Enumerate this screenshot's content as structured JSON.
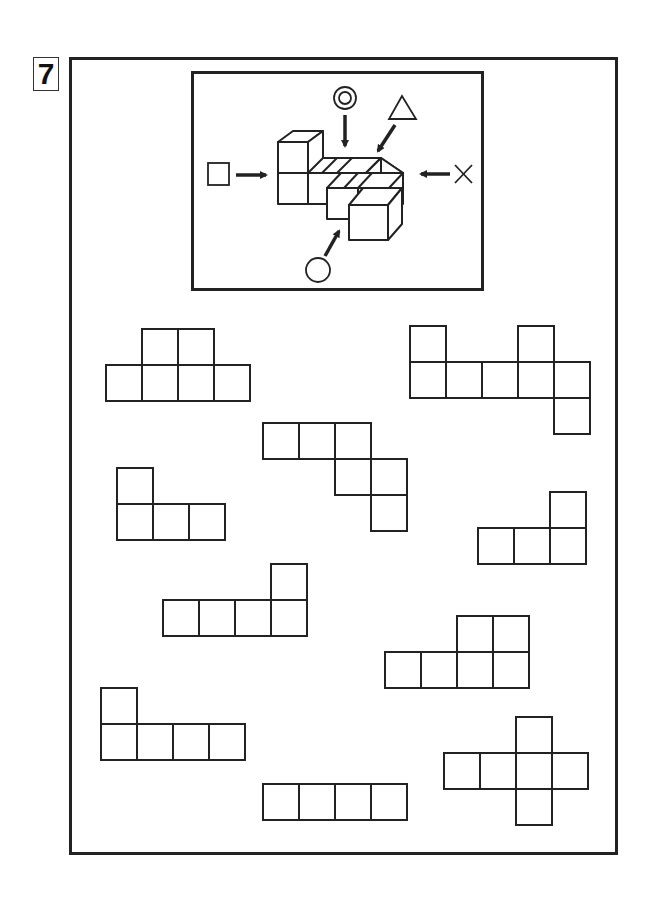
{
  "problem": {
    "number": "7"
  },
  "colors": {
    "stroke": "#222222",
    "background": "#ffffff"
  },
  "view_figure": {
    "description": "isometric block figure with five viewing-direction markers",
    "markers": [
      {
        "symbol": "square",
        "direction": "from-left"
      },
      {
        "symbol": "double-circle",
        "direction": "from-top"
      },
      {
        "symbol": "triangle",
        "direction": "from-top-right"
      },
      {
        "symbol": "cross",
        "direction": "from-right"
      },
      {
        "symbol": "circle",
        "direction": "from-front-bottom"
      }
    ]
  },
  "cell_size": 36,
  "nets": [
    {
      "id": "net-1",
      "x": 106,
      "y": 329,
      "cells": [
        [
          0,
          1
        ],
        [
          0,
          2
        ],
        [
          1,
          0
        ],
        [
          1,
          1
        ],
        [
          1,
          2
        ],
        [
          1,
          3
        ]
      ]
    },
    {
      "id": "net-2",
      "x": 410,
      "y": 326,
      "cells": [
        [
          0,
          0
        ],
        [
          0,
          3
        ],
        [
          1,
          0
        ],
        [
          1,
          1
        ],
        [
          1,
          2
        ],
        [
          1,
          3
        ],
        [
          1,
          4
        ],
        [
          2,
          4
        ]
      ]
    },
    {
      "id": "net-3",
      "x": 263,
      "y": 423,
      "cells": [
        [
          0,
          0
        ],
        [
          0,
          1
        ],
        [
          0,
          2
        ],
        [
          1,
          2
        ],
        [
          1,
          3
        ],
        [
          2,
          3
        ]
      ]
    },
    {
      "id": "net-4",
      "x": 117,
      "y": 468,
      "cells": [
        [
          0,
          0
        ],
        [
          1,
          0
        ],
        [
          1,
          1
        ],
        [
          1,
          2
        ]
      ]
    },
    {
      "id": "net-5",
      "x": 478,
      "y": 492,
      "cells": [
        [
          0,
          2
        ],
        [
          1,
          0
        ],
        [
          1,
          1
        ],
        [
          1,
          2
        ]
      ]
    },
    {
      "id": "net-6",
      "x": 163,
      "y": 564,
      "cells": [
        [
          0,
          3
        ],
        [
          1,
          0
        ],
        [
          1,
          1
        ],
        [
          1,
          2
        ],
        [
          1,
          3
        ]
      ]
    },
    {
      "id": "net-7",
      "x": 385,
      "y": 616,
      "cells": [
        [
          0,
          2
        ],
        [
          0,
          3
        ],
        [
          1,
          0
        ],
        [
          1,
          1
        ],
        [
          1,
          2
        ],
        [
          1,
          3
        ]
      ]
    },
    {
      "id": "net-8",
      "x": 101,
      "y": 688,
      "cells": [
        [
          0,
          0
        ],
        [
          1,
          0
        ],
        [
          1,
          1
        ],
        [
          1,
          2
        ],
        [
          1,
          3
        ]
      ]
    },
    {
      "id": "net-9",
      "x": 444,
      "y": 717,
      "cells": [
        [
          0,
          2
        ],
        [
          1,
          0
        ],
        [
          1,
          1
        ],
        [
          1,
          2
        ],
        [
          1,
          3
        ],
        [
          2,
          2
        ]
      ]
    },
    {
      "id": "net-10",
      "x": 263,
      "y": 784,
      "cells": [
        [
          0,
          0
        ],
        [
          0,
          1
        ],
        [
          0,
          2
        ],
        [
          0,
          3
        ]
      ]
    }
  ]
}
